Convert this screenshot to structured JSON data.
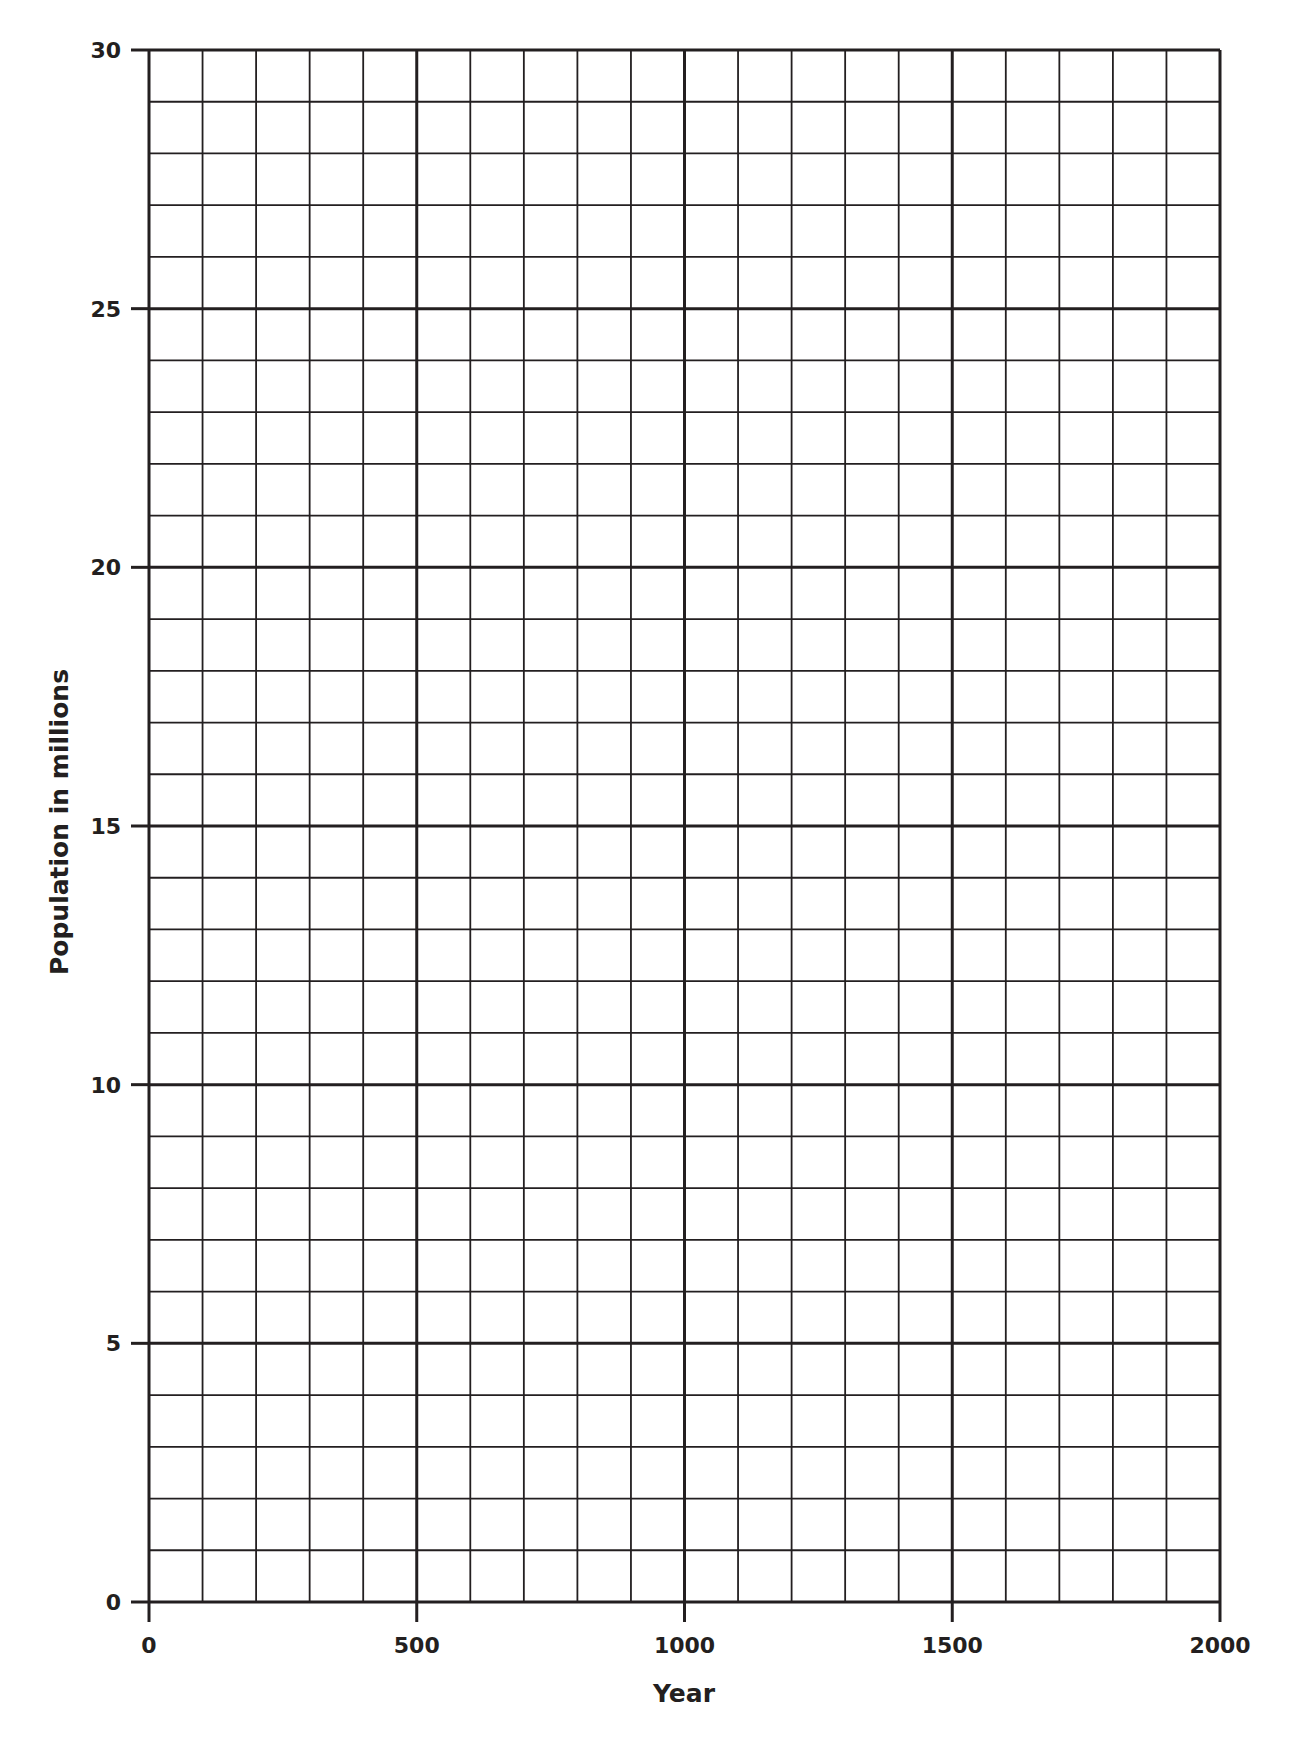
{
  "chart_data": {
    "type": "line",
    "title": "",
    "xlabel": "Year",
    "ylabel": "Population in millions",
    "xlim": [
      0,
      2000
    ],
    "ylim": [
      0,
      30
    ],
    "x_ticks": [
      0,
      500,
      1000,
      1500,
      2000
    ],
    "x_tick_labels": [
      "0",
      "500",
      "1000",
      "1500",
      "2000"
    ],
    "y_ticks": [
      0,
      5,
      10,
      15,
      20,
      25,
      30
    ],
    "y_tick_labels": [
      "0",
      "5",
      "10",
      "15",
      "20",
      "25",
      "30"
    ],
    "x_minor_step": 100,
    "y_minor_step": 1,
    "grid": true,
    "legend": null,
    "series": [],
    "note": "Blank graph paper grid; no data plotted"
  },
  "colors": {
    "grid_line": "#231f20",
    "background": "#ffffff"
  }
}
